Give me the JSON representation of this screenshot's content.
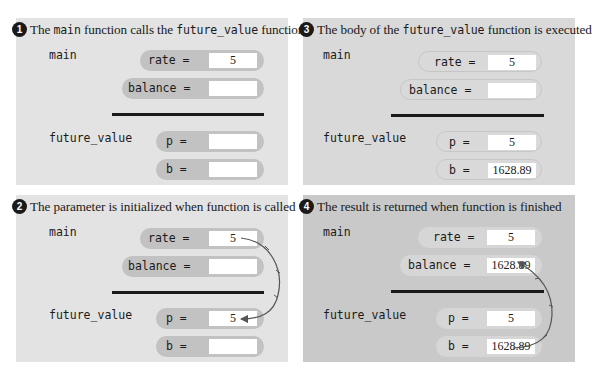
{
  "panels": [
    {
      "number": "1",
      "title_parts": [
        "The ",
        "main",
        " function calls the ",
        "future_value",
        " function"
      ],
      "frames": {
        "main": {
          "label": "main",
          "vars": [
            {
              "name": "rate =",
              "value": "5"
            },
            {
              "name": "balance =",
              "value": ""
            }
          ]
        },
        "future_value": {
          "label": "future_value",
          "vars": [
            {
              "name": "p =",
              "value": ""
            },
            {
              "name": "b =",
              "value": ""
            }
          ]
        }
      }
    },
    {
      "number": "2",
      "title": "The parameter is initialized when function is called",
      "frames": {
        "main": {
          "label": "main",
          "vars": [
            {
              "name": "rate =",
              "value": "5"
            },
            {
              "name": "balance =",
              "value": ""
            }
          ]
        },
        "future_value": {
          "label": "future_value",
          "vars": [
            {
              "name": "p =",
              "value": "5"
            },
            {
              "name": "b =",
              "value": ""
            }
          ]
        }
      },
      "arrow": {
        "from": "rate",
        "to": "p"
      }
    },
    {
      "number": "3",
      "title_parts": [
        "The body of the ",
        "future_value",
        " function is executed"
      ],
      "frames": {
        "main": {
          "label": "main",
          "vars": [
            {
              "name": "rate =",
              "value": "5"
            },
            {
              "name": "balance =",
              "value": ""
            }
          ]
        },
        "future_value": {
          "label": "future_value",
          "vars": [
            {
              "name": "p =",
              "value": "5"
            },
            {
              "name": "b =",
              "value": "1628.89"
            }
          ]
        }
      }
    },
    {
      "number": "4",
      "title": "The result is returned when function is finished",
      "frames": {
        "main": {
          "label": "main",
          "vars": [
            {
              "name": "rate =",
              "value": "5"
            },
            {
              "name": "balance =",
              "value": "1628.89"
            }
          ]
        },
        "future_value": {
          "label": "future_value",
          "vars": [
            {
              "name": "p =",
              "value": "5"
            },
            {
              "name": "b =",
              "value": "1628.89"
            }
          ]
        }
      },
      "arrow": {
        "from": "b",
        "to": "balance"
      }
    }
  ],
  "colors": {
    "panel_bg": "#e3e3e3",
    "panel3_bg": "#d9d9d9",
    "panel4_bg": "#c9c9c9",
    "pill_bg": "#c2c2c2",
    "arrow": "#555555"
  }
}
